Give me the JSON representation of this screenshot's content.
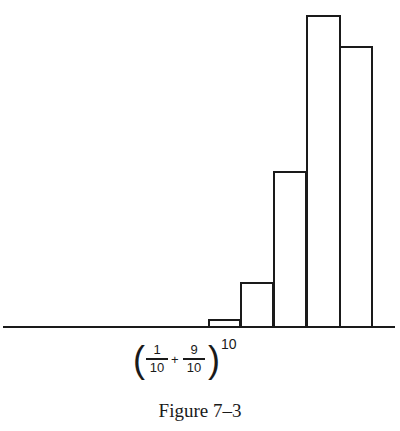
{
  "chart_data": {
    "type": "bar",
    "title": "",
    "caption": "Figure 7–3",
    "xlabel": "(1/10 + 9/10)^10",
    "ylabel": "",
    "categories": [
      "6",
      "7",
      "8",
      "9",
      "10"
    ],
    "values": [
      0.011,
      0.057,
      0.194,
      0.387,
      0.349
    ],
    "grid": false,
    "legend": null,
    "axis": {
      "x_baseline": true,
      "y_axis": false,
      "tick_labels": false
    },
    "ylim": [
      0,
      0.4
    ]
  },
  "figure": {
    "formula": {
      "frac1_num": "1",
      "frac1_den": "10",
      "plus": "+",
      "frac2_num": "9",
      "frac2_den": "10",
      "exponent": "10",
      "open_paren": "(",
      "close_paren": ")"
    },
    "caption": "Figure 7–3"
  },
  "layout": {
    "baseline_y": 328,
    "pixels_per_unit": 808,
    "bars": [
      {
        "x": 208,
        "w": 33
      },
      {
        "x": 240,
        "w": 34
      },
      {
        "x": 273,
        "w": 34
      },
      {
        "x": 306,
        "w": 35
      },
      {
        "x": 339,
        "w": 34
      }
    ]
  }
}
